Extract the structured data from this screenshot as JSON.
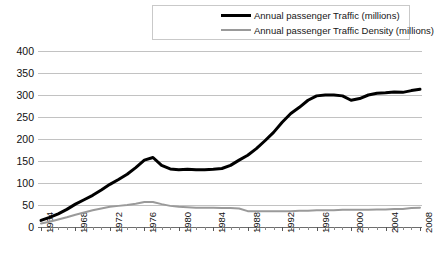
{
  "chart_data": {
    "type": "line",
    "title": "",
    "subtitle": "",
    "xlabel": "",
    "ylabel": "",
    "xlim": [
      1964,
      2008
    ],
    "ylim": [
      0,
      400
    ],
    "yticks": [
      0,
      50,
      100,
      150,
      200,
      250,
      300,
      350,
      400
    ],
    "xticks": [
      1964,
      1968,
      1972,
      1976,
      1980,
      1984,
      1988,
      1992,
      1996,
      2000,
      2004,
      2008
    ],
    "grid": true,
    "legend_position": "top-center",
    "x": [
      1964,
      1965,
      1966,
      1967,
      1968,
      1969,
      1970,
      1971,
      1972,
      1973,
      1974,
      1975,
      1976,
      1977,
      1978,
      1979,
      1980,
      1981,
      1982,
      1983,
      1984,
      1985,
      1986,
      1987,
      1988,
      1989,
      1990,
      1991,
      1992,
      1993,
      1994,
      1995,
      1996,
      1997,
      1998,
      1999,
      2000,
      2001,
      2002,
      2003,
      2004,
      2005,
      2006,
      2007,
      2008
    ],
    "series": [
      {
        "name": "Annual passenger Traffic (millions)",
        "color": "#000000",
        "width": 3,
        "values": [
          15,
          22,
          30,
          40,
          52,
          62,
          72,
          84,
          97,
          108,
          120,
          135,
          152,
          158,
          140,
          132,
          130,
          131,
          130,
          130,
          131,
          133,
          140,
          152,
          163,
          178,
          196,
          215,
          238,
          258,
          272,
          288,
          298,
          300,
          300,
          298,
          288,
          292,
          300,
          304,
          305,
          307,
          306,
          310,
          313
        ]
      },
      {
        "name": "Annual passenger Traffic Density (millions)",
        "color": "#9a9a9a",
        "width": 2,
        "values": [
          8,
          12,
          17,
          22,
          28,
          33,
          38,
          42,
          46,
          48,
          50,
          53,
          57,
          57,
          52,
          48,
          46,
          45,
          44,
          44,
          44,
          43,
          43,
          42,
          36,
          36,
          36,
          36,
          36,
          36,
          37,
          37,
          38,
          38,
          38,
          39,
          39,
          39,
          39,
          40,
          40,
          41,
          41,
          43,
          44
        ]
      }
    ]
  },
  "legend": {
    "entries": [
      {
        "label": "Annual passenger Traffic (millions)",
        "swatch": "line-swatch-black"
      },
      {
        "label": "Annual passenger Traffic Density (millions)",
        "swatch": "line-swatch-gray"
      }
    ]
  },
  "axes": {
    "y_tick_labels": [
      "400",
      "350",
      "300",
      "250",
      "200",
      "150",
      "100",
      "50",
      "0"
    ],
    "x_tick_labels": [
      "1964",
      "1968",
      "1972",
      "1976",
      "1980",
      "1984",
      "1988",
      "1992",
      "1996",
      "2000",
      "2004",
      "2008"
    ]
  },
  "colors": {
    "series_primary": "#000000",
    "series_secondary": "#9a9a9a",
    "grid": "#c2c2c2",
    "axis": "#6d6d6d",
    "text": "#111111",
    "background": "#ffffff"
  }
}
